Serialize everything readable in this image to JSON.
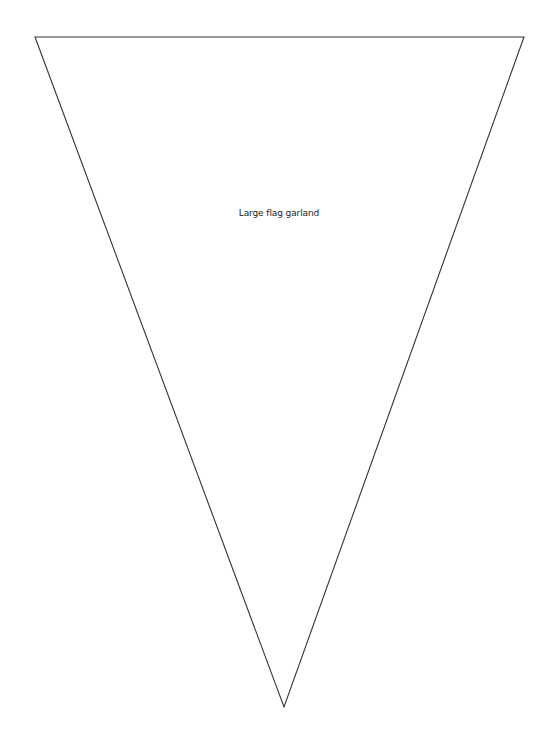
{
  "document": {
    "label": "Large flag garland",
    "shape": {
      "type": "triangle",
      "points": [
        [
          35,
          37
        ],
        [
          524,
          37
        ],
        [
          284,
          707
        ]
      ],
      "stroke": "#333333",
      "fill": "#ffffff"
    }
  }
}
